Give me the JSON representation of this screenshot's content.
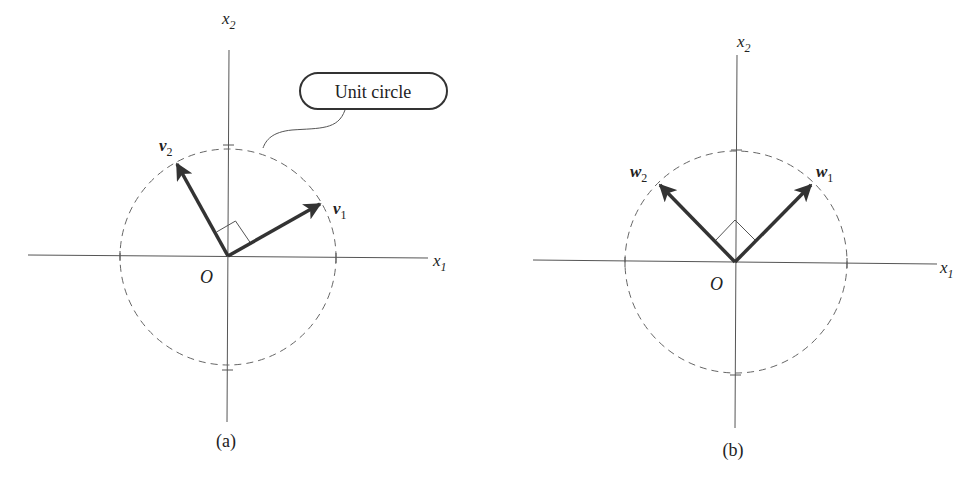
{
  "figure": {
    "panels": [
      {
        "id": "a",
        "caption": "(a)",
        "axes": {
          "x_label": "x",
          "x_sub": "1",
          "y_label": "x",
          "y_sub": "2"
        },
        "origin_label": "O",
        "circle_label": "Unit circle",
        "vectors": [
          {
            "name": "v",
            "sub": "1",
            "angle_deg": 30
          },
          {
            "name": "v",
            "sub": "2",
            "angle_deg": 120
          }
        ],
        "right_angle_marker": true
      },
      {
        "id": "b",
        "caption": "(b)",
        "axes": {
          "x_label": "x",
          "x_sub": "1",
          "y_label": "x",
          "y_sub": "2"
        },
        "origin_label": "O",
        "vectors": [
          {
            "name": "w",
            "sub": "1",
            "angle_deg": 45
          },
          {
            "name": "w",
            "sub": "2",
            "angle_deg": 135
          }
        ],
        "right_angle_marker": true
      }
    ]
  }
}
